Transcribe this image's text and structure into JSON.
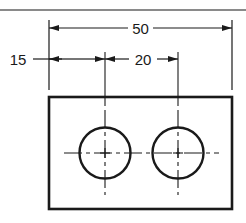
{
  "drawing": {
    "type": "engineering-drawing",
    "colors": {
      "line": "#1a1a1a",
      "rule": "#8a8a8a",
      "background": "#ffffff"
    },
    "dimensions": {
      "overall_width": {
        "label": "50",
        "value": 50
      },
      "edge_to_first_hole": {
        "label": "15",
        "value": 15
      },
      "hole_spacing": {
        "label": "20",
        "value": 20
      }
    },
    "part": {
      "shape": "rectangle-plate",
      "holes": [
        {
          "name": "hole-1",
          "position_from_left": 15
        },
        {
          "name": "hole-2",
          "position_from_left": 35
        }
      ]
    }
  }
}
